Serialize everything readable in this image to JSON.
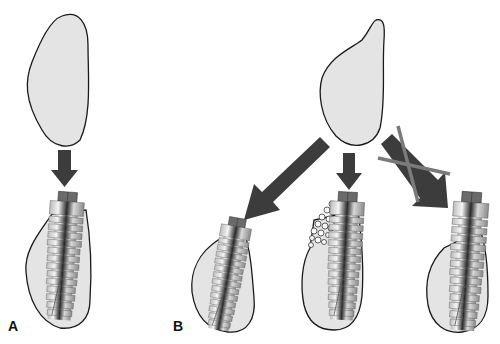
{
  "figure": {
    "panels": [
      {
        "label": "A",
        "description": "Single bone graft block shaped to fit defect; implant placed fully within bone"
      },
      {
        "label": "B",
        "description": "Bone graft block with three outcomes: implant tilted into bone, implant with particulate graft filling defect, implant protruding (crossed out)"
      }
    ]
  },
  "colors": {
    "bone_fill": "#e4e4e4",
    "outline": "#1a1a1a",
    "arrow": "#3c3c3c",
    "cross": "#7a7a7a",
    "implant_light": "#f2f2f2",
    "implant_dark": "#2a2a2a",
    "implant_cap": "#6a6a6a"
  }
}
